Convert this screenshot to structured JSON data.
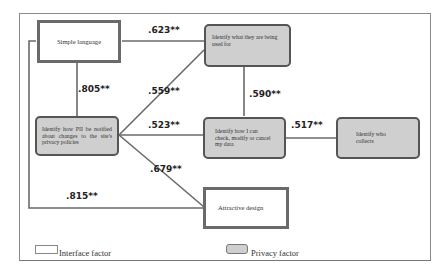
{
  "nodes": {
    "simple_language": {
      "label": "Simple language",
      "type": "interface"
    },
    "identify_used_for": {
      "label": "Identify what they are being used for",
      "type": "privacy"
    },
    "identify_notified": {
      "label": "Identify how PII be notified about changes to the site's privacy policies",
      "type": "privacy"
    },
    "identify_check_modify": {
      "label": "Identify how I can check, modify or cancel my data",
      "type": "privacy"
    },
    "identify_who_collects": {
      "label": "Identify who collects",
      "type": "privacy"
    },
    "attractive_design": {
      "label": "Attractive design",
      "type": "interface"
    }
  },
  "edges": [
    {
      "from": "simple_language",
      "to": "identify_used_for",
      "label": ".623**"
    },
    {
      "from": "simple_language",
      "to": "identify_notified",
      "label": ".805**"
    },
    {
      "from": "identify_notified",
      "to": "identify_used_for",
      "label": ".559**"
    },
    {
      "from": "identify_used_for",
      "to": "identify_check_modify",
      "label": ".590**"
    },
    {
      "from": "identify_notified",
      "to": "identify_check_modify",
      "label": ".523**"
    },
    {
      "from": "identify_check_modify",
      "to": "identify_who_collects",
      "label": ".517**"
    },
    {
      "from": "identify_notified",
      "to": "attractive_design",
      "label": ".679**"
    },
    {
      "from": "simple_language",
      "to": "attractive_design",
      "label": ".815**"
    }
  ],
  "legend": {
    "interface": "Interface factor",
    "privacy": "Privacy factor"
  },
  "colors": {
    "interface_fill": "#ffffff",
    "privacy_fill": "#cfcfcf",
    "border": "#5a5a5a"
  }
}
